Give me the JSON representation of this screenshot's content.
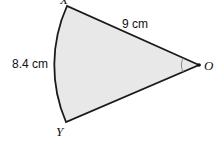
{
  "diagram": {
    "type": "sector",
    "points": {
      "X": "X",
      "Y": "Y",
      "O": "O"
    },
    "labels": {
      "radius": "9 cm",
      "arc_length": "8.4 cm"
    },
    "colors": {
      "fill": "#e8e8e8",
      "stroke": "#1a1a1a",
      "angle_mark": "#888888"
    }
  }
}
